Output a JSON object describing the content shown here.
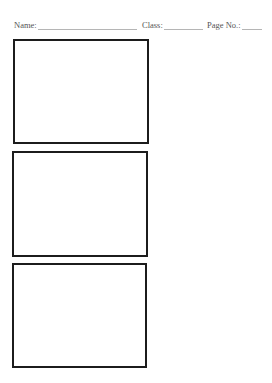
{
  "header": {
    "name_label": "Name:",
    "class_label": "Class:",
    "page_label": "Page No.:",
    "name_value": "",
    "class_value": "",
    "page_value": ""
  },
  "panels": [
    {
      "id": "panel-1",
      "content": ""
    },
    {
      "id": "panel-2",
      "content": ""
    },
    {
      "id": "panel-3",
      "content": ""
    }
  ],
  "colors": {
    "border": "#1c1c1c",
    "text": "#555555",
    "underline": "#b5b5b5"
  }
}
